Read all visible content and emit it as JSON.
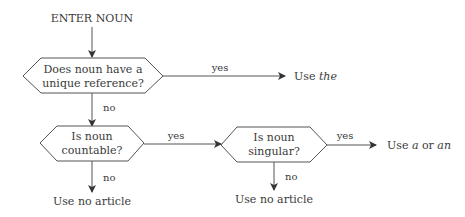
{
  "diagram": {
    "type": "flowchart",
    "start": {
      "label": "ENTER NOUN"
    },
    "decisions": [
      {
        "id": "q1",
        "line1": "Does noun have a",
        "line2": "unique reference?"
      },
      {
        "id": "q2",
        "line1": "Is noun",
        "line2": "countable?"
      },
      {
        "id": "q3",
        "line1": "Is noun",
        "line2": "singular?"
      }
    ],
    "edges": {
      "q1_yes": "yes",
      "q1_no": "no",
      "q2_yes": "yes",
      "q2_no": "no",
      "q3_yes": "yes",
      "q3_no": "no"
    },
    "outcomes": {
      "use_the": {
        "prefix": "Use ",
        "article": "the"
      },
      "use_a_an": {
        "prefix": "Use ",
        "a": "a",
        "or": " or ",
        "an": "an"
      },
      "no_article_1": "Use no article",
      "no_article_2": "Use no article"
    },
    "colors": {
      "line": "#555555",
      "text": "#3a3a3a",
      "background": "#ffffff"
    }
  }
}
